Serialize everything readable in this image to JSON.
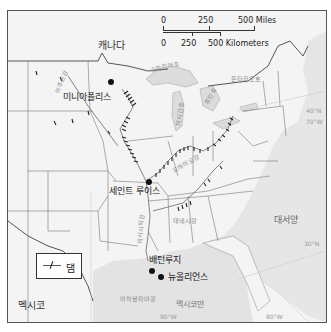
{
  "scale_bar": {
    "miles_ticks": [
      "0",
      "250",
      "500 Miles"
    ],
    "km_ticks": [
      "0",
      "250",
      "500 Kilometers"
    ]
  },
  "labels": {
    "canada": "캐나다",
    "mexico": "멕시코",
    "atlantic": "대서양",
    "gulf": "멕시코만",
    "gulf_river_mouth": "아차팔라야강"
  },
  "cities": [
    {
      "name": "미니아폴리스"
    },
    {
      "name": "세인트 루이스"
    },
    {
      "name": "배턴루지"
    },
    {
      "name": "뉴올리언스"
    }
  ],
  "water_labels": {
    "lake_superior": "슈피리어호",
    "lake_michigan": "미시간호",
    "lake_huron": "휴런호",
    "lake_ontario": "온타리오호",
    "missouri_river": "미주리강",
    "ohio_river": "오하이오강",
    "mississippi_river": "미시시피강",
    "tennessee_river": "테네시강"
  },
  "grid_labels": {
    "lat_40": "40°N",
    "lon_70": "70°W",
    "lat_30": "30°N",
    "lon_90": "90°W",
    "lon_80": "80°W"
  },
  "legend": {
    "dam_label": "댐"
  }
}
